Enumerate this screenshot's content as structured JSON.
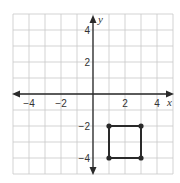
{
  "chart_data": {
    "type": "scatter",
    "title": "",
    "xlabel": "x",
    "ylabel": "y",
    "xlim": [
      -5,
      5
    ],
    "ylim": [
      -5,
      5
    ],
    "grid": true,
    "grid_step": 1,
    "x_tick_labels": [
      {
        "value": -4,
        "label": "−4"
      },
      {
        "value": -2,
        "label": "−2"
      },
      {
        "value": 2,
        "label": "2"
      },
      {
        "value": 4,
        "label": "4"
      }
    ],
    "y_tick_labels": [
      {
        "value": 4,
        "label": "4"
      },
      {
        "value": 2,
        "label": "2"
      },
      {
        "value": -2,
        "label": "−2"
      },
      {
        "value": -4,
        "label": "−4"
      }
    ],
    "series": [
      {
        "name": "square",
        "closed": true,
        "points": [
          {
            "x": 1,
            "y": -2
          },
          {
            "x": 3,
            "y": -2
          },
          {
            "x": 3,
            "y": -4
          },
          {
            "x": 1,
            "y": -4
          }
        ]
      }
    ]
  },
  "colors": {
    "grid": "#c8c8c8",
    "axis": "#2a2a2a",
    "shape": "#2a2a2a",
    "background": "#ffffff"
  }
}
